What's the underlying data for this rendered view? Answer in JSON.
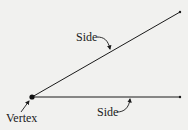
{
  "diagram": {
    "labels": {
      "side_upper": "Side",
      "side_lower": "Side",
      "vertex": "Vertex"
    },
    "elements": {
      "vertex": {
        "x": 32,
        "y": 97
      },
      "ray_upper": {
        "from": [
          32,
          97
        ],
        "to": [
          180,
          12
        ]
      },
      "ray_lower": {
        "from": [
          32,
          97
        ],
        "to": [
          180,
          97
        ]
      }
    },
    "colors": {
      "background": "#f1f1ef",
      "stroke": "#1a1a1a"
    }
  }
}
